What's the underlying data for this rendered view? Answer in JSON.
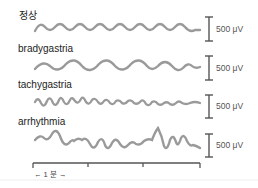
{
  "traces": [
    {
      "label": "정상",
      "scale": "500 μV",
      "type": "normal"
    },
    {
      "label": "bradygastria",
      "scale": "500 μV",
      "type": "bradygastria"
    },
    {
      "label": "tachygastria",
      "scale": "500 μV",
      "type": "tachygastria"
    },
    {
      "label": "arrhythmia",
      "scale": "500 μV",
      "type": "arrhythmia"
    }
  ],
  "time_scale": {
    "label": "← 1 분 →",
    "unit": "1 분"
  },
  "colors": {
    "trace": "#9a9a9a",
    "scalebar": "#555555",
    "text": "#222222"
  }
}
